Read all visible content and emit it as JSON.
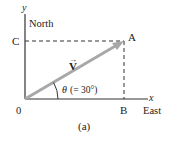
{
  "diagram": {
    "axes": {
      "y_label": "y",
      "y_direction": "North",
      "x_label": "x",
      "x_direction": "East",
      "origin_label": "0"
    },
    "points": {
      "A": "A",
      "B": "B",
      "C": "C"
    },
    "vector": {
      "label": "V",
      "arrow_glyph": "→",
      "color": "#a8a8a8"
    },
    "angle": {
      "symbol": "θ",
      "text": "(= 30°)",
      "degrees": 30
    },
    "caption": "(a)",
    "colors": {
      "axis": "#333333",
      "dashed": "#333333",
      "text": "#222222"
    }
  }
}
